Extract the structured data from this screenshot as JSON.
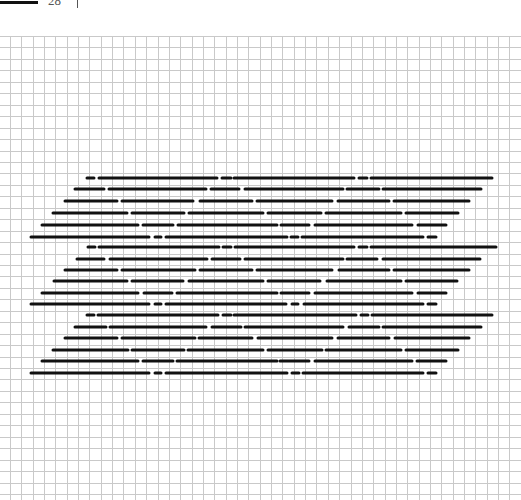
{
  "header": {
    "label": "28",
    "bar_color": "#111111"
  },
  "grid": {
    "origin_x": 10,
    "origin_y": 36,
    "spacing_x": 11.35,
    "spacing_y": 11.45,
    "line_color": "#c9c9c9",
    "extent": [
      521,
      500
    ]
  },
  "pattern": {
    "stroke_color": "#111111",
    "stroke_width": 3,
    "blocks": [
      {
        "name": "block-1",
        "rows": [
          {
            "y": 178,
            "segments": [
              [
                87,
                94
              ],
              [
                99,
                217
              ],
              [
                222,
                231
              ],
              [
                234,
                354
              ],
              [
                359,
                367
              ],
              [
                371,
                492
              ]
            ]
          },
          {
            "y": 189,
            "segments": [
              [
                75,
                104
              ],
              [
                109,
                206
              ],
              [
                211,
                239
              ],
              [
                245,
                343
              ],
              [
                347,
                379
              ],
              [
                383,
                481
              ]
            ]
          },
          {
            "y": 201,
            "segments": [
              [
                65,
                117
              ],
              [
                122,
                193
              ],
              [
                200,
                252
              ],
              [
                257,
                332
              ],
              [
                338,
                389
              ],
              [
                394,
                469
              ]
            ]
          },
          {
            "y": 213,
            "segments": [
              [
                53,
                127
              ],
              [
                132,
                184
              ],
              [
                189,
                263
              ],
              [
                268,
                321
              ],
              [
                326,
                401
              ],
              [
                406,
                458
              ]
            ]
          },
          {
            "y": 225,
            "segments": [
              [
                42,
                138
              ],
              [
                143,
                173
              ],
              [
                178,
                277
              ],
              [
                281,
                309
              ],
              [
                315,
                412
              ],
              [
                418,
                446
              ]
            ]
          },
          {
            "y": 237,
            "segments": [
              [
                31,
                149
              ],
              [
                155,
                161
              ],
              [
                166,
                287
              ],
              [
                291,
                298
              ],
              [
                302,
                423
              ],
              [
                428,
                436
              ]
            ]
          }
        ]
      },
      {
        "name": "block-2",
        "rows": [
          {
            "y": 247,
            "segments": [
              [
                88,
                95
              ],
              [
                99,
                219
              ],
              [
                223,
                231
              ],
              [
                235,
                354
              ],
              [
                359,
                367
              ],
              [
                371,
                496
              ]
            ]
          },
          {
            "y": 259,
            "segments": [
              [
                77,
                104
              ],
              [
                110,
                207
              ],
              [
                212,
                240
              ],
              [
                245,
                343
              ],
              [
                347,
                377
              ],
              [
                383,
                480
              ]
            ]
          },
          {
            "y": 270,
            "segments": [
              [
                65,
                117
              ],
              [
                122,
                195
              ],
              [
                200,
                252
              ],
              [
                257,
                332
              ],
              [
                339,
                389
              ],
              [
                394,
                469
              ]
            ]
          },
          {
            "y": 281,
            "segments": [
              [
                54,
                127
              ],
              [
                132,
                183
              ],
              [
                189,
                263
              ],
              [
                268,
                320
              ],
              [
                327,
                401
              ],
              [
                406,
                457
              ]
            ]
          },
          {
            "y": 293,
            "segments": [
              [
                42,
                138
              ],
              [
                144,
                172
              ],
              [
                177,
                277
              ],
              [
                281,
                309
              ],
              [
                315,
                412
              ],
              [
                418,
                446
              ]
            ]
          },
          {
            "y": 304,
            "segments": [
              [
                31,
                149
              ],
              [
                155,
                161
              ],
              [
                166,
                286
              ],
              [
                292,
                298
              ],
              [
                304,
                423
              ],
              [
                428,
                436
              ]
            ]
          }
        ]
      },
      {
        "name": "block-3",
        "rows": [
          {
            "y": 315,
            "segments": [
              [
                87,
                94
              ],
              [
                98,
                218
              ],
              [
                223,
                231
              ],
              [
                234,
                356
              ],
              [
                361,
                368
              ],
              [
                372,
                492
              ]
            ]
          },
          {
            "y": 327,
            "segments": [
              [
                75,
                106
              ],
              [
                110,
                206
              ],
              [
                212,
                241
              ],
              [
                245,
                343
              ],
              [
                349,
                379
              ],
              [
                383,
                481
              ]
            ]
          },
          {
            "y": 338,
            "segments": [
              [
                65,
                117
              ],
              [
                122,
                195
              ],
              [
                199,
                252
              ],
              [
                258,
                332
              ],
              [
                338,
                389
              ],
              [
                395,
                469
              ]
            ]
          },
          {
            "y": 350,
            "segments": [
              [
                53,
                128
              ],
              [
                132,
                184
              ],
              [
                188,
                263
              ],
              [
                268,
                322
              ],
              [
                326,
                401
              ],
              [
                406,
                458
              ]
            ]
          },
          {
            "y": 361,
            "segments": [
              [
                42,
                138
              ],
              [
                143,
                173
              ],
              [
                177,
                277
              ],
              [
                280,
                309
              ],
              [
                315,
                412
              ],
              [
                417,
                446
              ]
            ]
          },
          {
            "y": 373,
            "segments": [
              [
                31,
                149
              ],
              [
                155,
                161
              ],
              [
                166,
                287
              ],
              [
                292,
                299
              ],
              [
                303,
                423
              ],
              [
                428,
                436
              ]
            ]
          }
        ]
      }
    ]
  }
}
